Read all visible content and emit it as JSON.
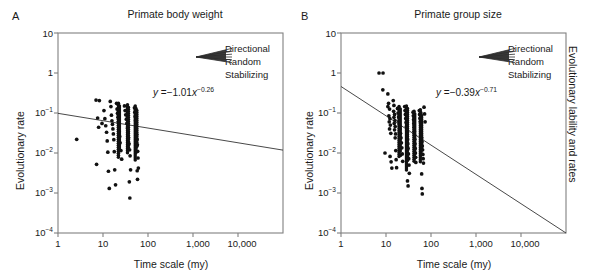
{
  "figure": {
    "panels": [
      {
        "letter": "A",
        "title": "Primate body weight",
        "equation": {
          "lhs": "y",
          "eq": "=",
          "coef": "−1.01",
          "var": "x",
          "exponent": "−0.26"
        },
        "ylabel": "Evolutionary rate",
        "xlabel": "Time scale (my)",
        "legend": {
          "items": [
            "Directional",
            "Random",
            "Stabilizing"
          ]
        }
      },
      {
        "letter": "B",
        "title": "Primate group size",
        "equation": {
          "lhs": "y",
          "eq": "=",
          "coef": "−0.39",
          "var": "x",
          "exponent": "−0.71"
        },
        "ylabel": "Evolutionary rate",
        "ylabel_right": "Evolutionary lability and rates",
        "xlabel": "Time scale (my)",
        "legend": {
          "items": [
            "Directional",
            "Random",
            "Stabilizing"
          ]
        }
      }
    ],
    "axes": {
      "yticks": [
        {
          "mantissa": "10",
          "exp": ""
        },
        {
          "mantissa": "1",
          "exp": ""
        },
        {
          "mantissa": "10",
          "exp": "−1"
        },
        {
          "mantissa": "10",
          "exp": "−2"
        },
        {
          "mantissa": "10",
          "exp": "−3"
        },
        {
          "mantissa": "10",
          "exp": "−4"
        }
      ],
      "xticks": [
        "1",
        "10",
        "100",
        "1,000",
        "10,000"
      ]
    },
    "colors": {
      "ink": "#1a1a1a",
      "axis": "#808080",
      "marker": "#111111",
      "line": "#333333"
    }
  },
  "chart_data": [
    {
      "type": "scatter",
      "panel": "A",
      "title": "Primate body weight",
      "xlabel": "Time scale (my)",
      "ylabel": "Evolutionary rate",
      "xscale": "log",
      "yscale": "log",
      "xlim": [
        1,
        100000
      ],
      "ylim": [
        0.0001,
        10
      ],
      "xtick_values": [
        1,
        10,
        100,
        1000,
        10000
      ],
      "ytick_values": [
        10,
        1,
        0.1,
        0.01,
        0.001,
        0.0001
      ],
      "grid": false,
      "fit": {
        "label": "y = −1.01x^−0.26",
        "intercept": -1.01,
        "slope": -0.26,
        "endpoints": [
          {
            "x": 1,
            "y": 0.098
          },
          {
            "x": 100000,
            "y": 0.0118
          }
        ]
      },
      "points": [
        {
          "x": 2.6,
          "y": 0.022
        },
        {
          "x": 7.0,
          "y": 0.21
        },
        {
          "x": 8.3,
          "y": 0.205
        },
        {
          "x": 9.5,
          "y": 0.055
        },
        {
          "x": 7.6,
          "y": 0.075
        },
        {
          "x": 8.0,
          "y": 0.044
        },
        {
          "x": 7.2,
          "y": 0.0052
        },
        {
          "x": 10.5,
          "y": 0.115
        },
        {
          "x": 11.0,
          "y": 0.072
        },
        {
          "x": 11.5,
          "y": 0.048
        },
        {
          "x": 12.0,
          "y": 0.033
        },
        {
          "x": 12.4,
          "y": 0.02
        },
        {
          "x": 12.8,
          "y": 0.0105
        },
        {
          "x": 13.2,
          "y": 0.0035
        },
        {
          "x": 13.8,
          "y": 0.0013
        },
        {
          "x": 14.5,
          "y": 0.195
        },
        {
          "x": 15.0,
          "y": 0.145
        },
        {
          "x": 15.4,
          "y": 0.088
        },
        {
          "x": 15.8,
          "y": 0.064
        },
        {
          "x": 16.2,
          "y": 0.052
        },
        {
          "x": 16.6,
          "y": 0.04
        },
        {
          "x": 17.0,
          "y": 0.03
        },
        {
          "x": 17.4,
          "y": 0.0215
        },
        {
          "x": 17.8,
          "y": 0.0108
        },
        {
          "x": 18.2,
          "y": 0.0038
        },
        {
          "x": 19.0,
          "y": 0.0016
        },
        {
          "x": 20.0,
          "y": 0.175
        },
        {
          "x": 20.5,
          "y": 0.125
        },
        {
          "x": 21.0,
          "y": 0.098
        },
        {
          "x": 21.5,
          "y": 0.078
        },
        {
          "x": 22.0,
          "y": 0.06
        },
        {
          "x": 22.5,
          "y": 0.046
        },
        {
          "x": 23.0,
          "y": 0.034
        },
        {
          "x": 23.5,
          "y": 0.026
        },
        {
          "x": 24.0,
          "y": 0.018
        },
        {
          "x": 25.0,
          "y": 0.0115
        },
        {
          "x": 26.0,
          "y": 0.007
        },
        {
          "x": 30.0,
          "y": 0.15
        },
        {
          "x": 31.0,
          "y": 0.115
        },
        {
          "x": 32.0,
          "y": 0.09
        },
        {
          "x": 33.0,
          "y": 0.07
        },
        {
          "x": 34.0,
          "y": 0.055
        },
        {
          "x": 35.0,
          "y": 0.042
        },
        {
          "x": 36.0,
          "y": 0.032
        },
        {
          "x": 37.0,
          "y": 0.024
        },
        {
          "x": 38.0,
          "y": 0.017
        },
        {
          "x": 39.0,
          "y": 0.012
        },
        {
          "x": 40.0,
          "y": 0.0085
        },
        {
          "x": 41.0,
          "y": 0.0038
        },
        {
          "x": 38.5,
          "y": 0.0019
        },
        {
          "x": 39.5,
          "y": 0.00075
        },
        {
          "x": 50.0,
          "y": 0.135
        },
        {
          "x": 51.0,
          "y": 0.105
        },
        {
          "x": 52.0,
          "y": 0.082
        },
        {
          "x": 53.0,
          "y": 0.065
        },
        {
          "x": 54.0,
          "y": 0.05
        },
        {
          "x": 55.0,
          "y": 0.038
        },
        {
          "x": 56.0,
          "y": 0.029
        },
        {
          "x": 57.0,
          "y": 0.022
        },
        {
          "x": 58.0,
          "y": 0.016
        },
        {
          "x": 59.0,
          "y": 0.011
        },
        {
          "x": 60.0,
          "y": 0.0075
        },
        {
          "x": 61.0,
          "y": 0.0042
        },
        {
          "x": 57.5,
          "y": 0.0036
        },
        {
          "x": 58.5,
          "y": 0.0022
        }
      ]
    },
    {
      "type": "scatter",
      "panel": "B",
      "title": "Primate group size",
      "xlabel": "Time scale (my)",
      "ylabel": "Evolutionary rate",
      "ylabel_right": "Evolutionary lability and rates",
      "xscale": "log",
      "yscale": "log",
      "xlim": [
        1,
        100000
      ],
      "ylim": [
        0.0001,
        10
      ],
      "xtick_values": [
        1,
        10,
        100,
        1000,
        10000
      ],
      "ytick_values": [
        10,
        1,
        0.1,
        0.01,
        0.001,
        0.0001
      ],
      "grid": false,
      "fit": {
        "label": "y = −0.39x^−0.71",
        "intercept": -0.39,
        "slope": -0.71,
        "endpoints": [
          {
            "x": 1,
            "y": 0.46
          },
          {
            "x": 100000,
            "y": 0.0001
          }
        ]
      },
      "points": [
        {
          "x": 7.0,
          "y": 1.0
        },
        {
          "x": 8.6,
          "y": 1.0
        },
        {
          "x": 8.5,
          "y": 0.38
        },
        {
          "x": 9.5,
          "y": 0.01
        },
        {
          "x": 11.0,
          "y": 0.3
        },
        {
          "x": 11.4,
          "y": 0.175
        },
        {
          "x": 11.0,
          "y": 0.145
        },
        {
          "x": 12.0,
          "y": 0.125
        },
        {
          "x": 11.6,
          "y": 0.085
        },
        {
          "x": 12.2,
          "y": 0.072
        },
        {
          "x": 11.8,
          "y": 0.06
        },
        {
          "x": 12.5,
          "y": 0.05
        },
        {
          "x": 12.0,
          "y": 0.04
        },
        {
          "x": 12.8,
          "y": 0.031
        },
        {
          "x": 12.3,
          "y": 0.0082
        },
        {
          "x": 13.0,
          "y": 0.006
        },
        {
          "x": 13.5,
          "y": 0.0042
        },
        {
          "x": 14.5,
          "y": 0.205
        },
        {
          "x": 15.0,
          "y": 0.155
        },
        {
          "x": 14.8,
          "y": 0.11
        },
        {
          "x": 15.5,
          "y": 0.092
        },
        {
          "x": 15.0,
          "y": 0.078
        },
        {
          "x": 15.8,
          "y": 0.065
        },
        {
          "x": 15.2,
          "y": 0.055
        },
        {
          "x": 16.0,
          "y": 0.046
        },
        {
          "x": 15.5,
          "y": 0.038
        },
        {
          "x": 16.3,
          "y": 0.03
        },
        {
          "x": 16.0,
          "y": 0.024
        },
        {
          "x": 16.5,
          "y": 0.0115
        },
        {
          "x": 16.8,
          "y": 0.0068
        },
        {
          "x": 17.2,
          "y": 0.0043
        },
        {
          "x": 18.0,
          "y": 0.13
        },
        {
          "x": 18.5,
          "y": 0.1
        },
        {
          "x": 19.0,
          "y": 0.08
        },
        {
          "x": 19.5,
          "y": 0.062
        },
        {
          "x": 20.0,
          "y": 0.05
        },
        {
          "x": 20.5,
          "y": 0.04
        },
        {
          "x": 21.0,
          "y": 0.031
        },
        {
          "x": 21.5,
          "y": 0.024
        },
        {
          "x": 22.0,
          "y": 0.018
        },
        {
          "x": 22.5,
          "y": 0.0135
        },
        {
          "x": 23.0,
          "y": 0.0095
        },
        {
          "x": 23.5,
          "y": 0.0062
        },
        {
          "x": 21.0,
          "y": 0.0088
        },
        {
          "x": 26.0,
          "y": 0.145
        },
        {
          "x": 26.5,
          "y": 0.115
        },
        {
          "x": 27.0,
          "y": 0.092
        },
        {
          "x": 27.5,
          "y": 0.073
        },
        {
          "x": 28.0,
          "y": 0.058
        },
        {
          "x": 28.5,
          "y": 0.046
        },
        {
          "x": 29.0,
          "y": 0.036
        },
        {
          "x": 29.5,
          "y": 0.028
        },
        {
          "x": 30.0,
          "y": 0.022
        },
        {
          "x": 30.5,
          "y": 0.017
        },
        {
          "x": 31.0,
          "y": 0.013
        },
        {
          "x": 31.5,
          "y": 0.0095
        },
        {
          "x": 32.0,
          "y": 0.0072
        },
        {
          "x": 32.5,
          "y": 0.005
        },
        {
          "x": 33.0,
          "y": 0.0031
        },
        {
          "x": 30.0,
          "y": 0.002
        },
        {
          "x": 31.0,
          "y": 0.0015
        },
        {
          "x": 40.0,
          "y": 0.105
        },
        {
          "x": 40.5,
          "y": 0.085
        },
        {
          "x": 41.0,
          "y": 0.068
        },
        {
          "x": 41.5,
          "y": 0.055
        },
        {
          "x": 42.0,
          "y": 0.044
        },
        {
          "x": 42.5,
          "y": 0.035
        },
        {
          "x": 43.0,
          "y": 0.028
        },
        {
          "x": 43.5,
          "y": 0.022
        },
        {
          "x": 44.0,
          "y": 0.017
        },
        {
          "x": 44.5,
          "y": 0.013
        },
        {
          "x": 45.0,
          "y": 0.01
        },
        {
          "x": 45.5,
          "y": 0.0078
        },
        {
          "x": 46.0,
          "y": 0.0058
        },
        {
          "x": 55.0,
          "y": 0.115
        },
        {
          "x": 56.0,
          "y": 0.092
        },
        {
          "x": 57.0,
          "y": 0.074
        },
        {
          "x": 58.0,
          "y": 0.06
        },
        {
          "x": 59.0,
          "y": 0.048
        },
        {
          "x": 60.0,
          "y": 0.038
        },
        {
          "x": 61.0,
          "y": 0.03
        },
        {
          "x": 62.0,
          "y": 0.024
        },
        {
          "x": 63.0,
          "y": 0.019
        },
        {
          "x": 64.0,
          "y": 0.015
        },
        {
          "x": 65.0,
          "y": 0.012
        },
        {
          "x": 66.0,
          "y": 0.0092
        },
        {
          "x": 67.0,
          "y": 0.0072
        },
        {
          "x": 68.0,
          "y": 0.0056
        },
        {
          "x": 62.0,
          "y": 0.003
        },
        {
          "x": 63.0,
          "y": 0.0013
        },
        {
          "x": 64.0,
          "y": 0.00095
        },
        {
          "x": 70.0,
          "y": 0.14
        },
        {
          "x": 72.0,
          "y": 0.095
        },
        {
          "x": 74.0,
          "y": 0.06
        }
      ]
    }
  ]
}
